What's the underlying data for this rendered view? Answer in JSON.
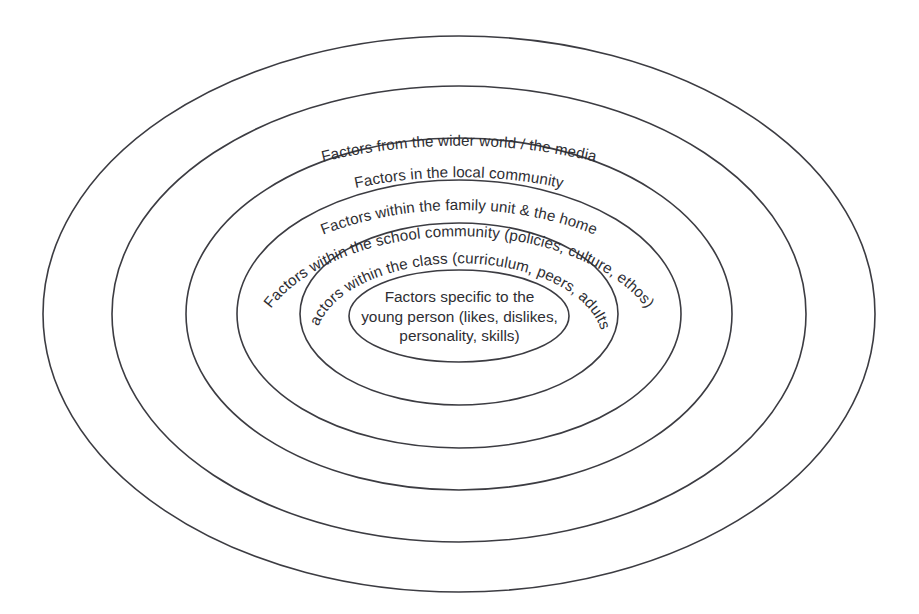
{
  "diagram": {
    "type": "concentric-ellipse-diagram",
    "background_color": "#ffffff",
    "stroke_color": "#3c3c42",
    "text_color": "#2e2e33",
    "canvas": {
      "width": 919,
      "height": 614
    },
    "center": {
      "x": 459,
      "y": 314
    },
    "rings": [
      {
        "index": 1,
        "level": "outermost",
        "name": "wider-world-media",
        "label": "Factors from the wider world / the media",
        "rx": 416,
        "ry": 278,
        "label_orientation": "curved-along-arc",
        "label_arc_offset": 36
      },
      {
        "index": 2,
        "level": "macro",
        "name": "local-community",
        "label": "Factors in the local community",
        "rx": 347,
        "ry": 228,
        "label_orientation": "curved-along-arc",
        "label_arc_offset": 34
      },
      {
        "index": 3,
        "level": "meso",
        "name": "family-unit-home",
        "label": "Factors within the family unit & the home",
        "rx": 273,
        "ry": 176,
        "label_orientation": "curved-along-arc",
        "label_arc_offset": 32
      },
      {
        "index": 4,
        "level": "school",
        "name": "school-community",
        "label": "Factors within the school community (policies, culture, ethos)",
        "rx": 222,
        "ry": 134,
        "label_orientation": "curved-along-arc",
        "label_arc_offset": 30
      },
      {
        "index": 5,
        "level": "class",
        "name": "class",
        "label": "Factors within the class (curriculum, peers, adults)",
        "rx": 159,
        "ry": 91,
        "label_orientation": "curved-along-arc",
        "label_arc_offset": 28
      },
      {
        "index": 6,
        "level": "innermost",
        "name": "young-person",
        "label": "Factors specific to the young person (likes, dislikes, personality, skills)",
        "rx": 110,
        "ry": 46,
        "label_orientation": "horizontal-centered",
        "label_lines": [
          "Factors specific to the",
          "young person (likes, dislikes,",
          "personality, skills)"
        ]
      }
    ]
  }
}
